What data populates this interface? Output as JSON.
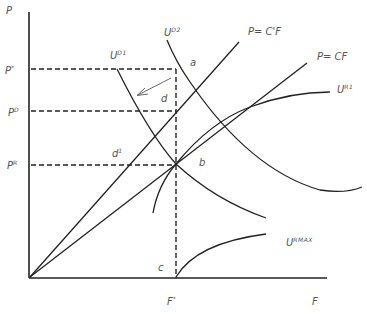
{
  "axes": {
    "y_label": "P",
    "x_label": "F"
  },
  "price_levels": {
    "p_star": {
      "base": "P",
      "sup": "*"
    },
    "p_d": {
      "base": "P",
      "sup": "D"
    },
    "p_r": {
      "base": "P",
      "sup": "R"
    }
  },
  "quantity_levels": {
    "f_star": {
      "base": "F",
      "sup": "*"
    }
  },
  "lines": {
    "c_prime": "P= C'F",
    "c": "P= CF"
  },
  "curves": {
    "u_d1": {
      "base": "U",
      "sup": "D1"
    },
    "u_d2": {
      "base": "U",
      "sup": "D2"
    },
    "u_r1": {
      "base": "U",
      "sup": "R1"
    },
    "u_rmax": {
      "base": "U",
      "sup": "RMAX"
    }
  },
  "points": {
    "a": "a",
    "b": "b",
    "c": "c",
    "d": "d",
    "d1": {
      "base": "d",
      "sup": "1"
    }
  },
  "colors": {
    "line": "#222222",
    "label": "#555555"
  }
}
